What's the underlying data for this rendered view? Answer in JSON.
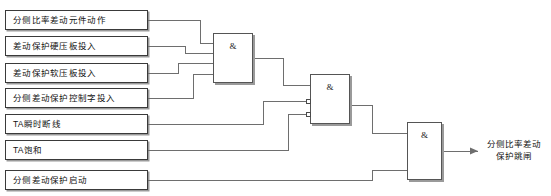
{
  "diagram": {
    "gate_symbol": "&",
    "inputs": [
      {
        "id": "in1",
        "label": "分侧比率差动元件动作"
      },
      {
        "id": "in2",
        "label": "差动保护硬压板投入"
      },
      {
        "id": "in3",
        "label": "差动保护软压板投入"
      },
      {
        "id": "in4",
        "label": "分侧差动保护控制字投入"
      },
      {
        "id": "in5",
        "label": "TA瞬时断线"
      },
      {
        "id": "in6",
        "label": "TA饱和"
      },
      {
        "id": "in7",
        "label": "分侧差动保护启动"
      }
    ],
    "gates": [
      {
        "id": "and1",
        "symbol": "&",
        "type": "AND",
        "input_count": 4,
        "inverted_inputs": []
      },
      {
        "id": "and2",
        "symbol": "&",
        "type": "AND",
        "input_count": 3,
        "inverted_inputs": [
          2,
          3
        ]
      },
      {
        "id": "and3",
        "symbol": "&",
        "type": "AND",
        "input_count": 2,
        "inverted_inputs": []
      }
    ],
    "output": {
      "line1": "分侧比率差动",
      "line2": "保护跳闸"
    },
    "colors": {
      "line": "#6e6e6e",
      "box_border": "#3a3a3a",
      "gate_border": "#555555",
      "shadow": "#9a9a9a",
      "text": "#111111",
      "background": "#ffffff"
    }
  }
}
